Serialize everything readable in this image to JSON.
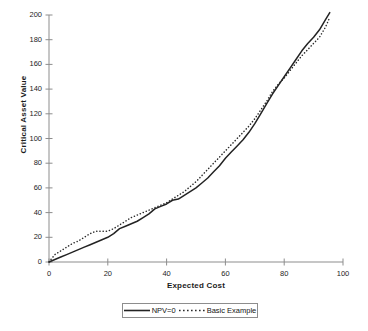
{
  "chart_data": {
    "type": "line",
    "title": "",
    "xlabel": "Expected Cost",
    "ylabel": "Critical Asset Value",
    "xlim": [
      0,
      100
    ],
    "ylim": [
      0,
      200
    ],
    "xticks": [
      0,
      20,
      40,
      60,
      80,
      100
    ],
    "yticks": [
      0,
      20,
      40,
      60,
      80,
      100,
      120,
      140,
      160,
      180,
      200
    ],
    "grid": false,
    "legend_position": "bottom-center",
    "series": [
      {
        "name": "NPV=0",
        "style": "solid",
        "color": "#232323",
        "x": [
          0,
          2,
          4,
          6,
          8,
          10,
          12,
          14,
          16,
          18,
          20,
          22,
          24,
          26,
          28,
          30,
          32,
          34,
          36,
          38,
          40,
          42,
          44,
          46,
          48,
          50,
          52,
          54,
          56,
          58,
          60,
          62,
          64,
          66,
          68,
          70,
          72,
          74,
          76,
          78,
          80,
          82,
          84,
          86,
          88,
          90,
          92,
          94,
          95.5
        ],
        "y": [
          0,
          2,
          4,
          6,
          8,
          10,
          12,
          14,
          16,
          18,
          20,
          23,
          27,
          29,
          31,
          33,
          36,
          39,
          43,
          45,
          47,
          50,
          51,
          54,
          57,
          60,
          64,
          68,
          73,
          78,
          84,
          89,
          94,
          99,
          105,
          112,
          120,
          128,
          136,
          143,
          150,
          157,
          164,
          171,
          177,
          182,
          188,
          196,
          202
        ]
      },
      {
        "name": "Basic Example",
        "style": "dotted",
        "color": "#2b2b2b",
        "x": [
          0,
          2,
          4,
          6,
          8,
          10,
          12,
          14,
          16,
          18,
          20,
          22,
          24,
          26,
          28,
          30,
          32,
          34,
          36,
          38,
          40,
          42,
          44,
          46,
          48,
          50,
          52,
          54,
          56,
          58,
          60,
          62,
          64,
          66,
          68,
          70,
          72,
          74,
          76,
          78,
          80,
          82,
          84,
          86,
          88,
          90,
          92,
          94,
          95.5
        ],
        "y": [
          0,
          6,
          9,
          12,
          15,
          17,
          20,
          23,
          25,
          25,
          25,
          27,
          30,
          33,
          36,
          38,
          40,
          42,
          44,
          46,
          48,
          51,
          54,
          57,
          61,
          65,
          70,
          75,
          80,
          85,
          90,
          95,
          100,
          105,
          110,
          116,
          123,
          130,
          138,
          144,
          149,
          155,
          161,
          167,
          172,
          177,
          182,
          190,
          198
        ]
      }
    ]
  },
  "axes": {
    "ytick_labels": [
      "0",
      "20",
      "40",
      "60",
      "80",
      "100",
      "120",
      "140",
      "160",
      "180",
      "200"
    ],
    "xtick_labels": [
      "0",
      "20",
      "40",
      "60",
      "80",
      "100"
    ],
    "xlabel": "Expected Cost",
    "ylabel": "Critical Asset Value"
  },
  "legend": {
    "entries": [
      {
        "label": "NPV=0",
        "style": "solid"
      },
      {
        "label": "Basic Example",
        "style": "dotted"
      }
    ]
  },
  "colors": {
    "axis": "#8d8d8d",
    "solid_series": "#232323",
    "dotted_series": "#2b2b2b",
    "text": "#1c1c1c",
    "background": "#ffffff"
  }
}
